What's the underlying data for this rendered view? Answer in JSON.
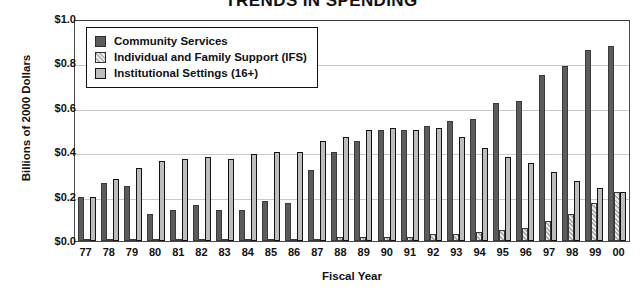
{
  "chart_data": {
    "type": "bar",
    "title": "TRENDS IN SPENDING",
    "xlabel": "Fiscal Year",
    "ylabel": "Billions of 2000 Dollars",
    "ylim": [
      0.0,
      1.0
    ],
    "ytick_labels": [
      "$1.0",
      "$0.8",
      "$0.6",
      "$0.4",
      "$0.2",
      "$0.0"
    ],
    "ytick_values": [
      1.0,
      0.8,
      0.6,
      0.4,
      0.2,
      0.0
    ],
    "grid": true,
    "legend_position": "upper-left",
    "categories": [
      "77",
      "78",
      "79",
      "80",
      "81",
      "82",
      "83",
      "84",
      "85",
      "86",
      "87",
      "88",
      "89",
      "90",
      "91",
      "92",
      "93",
      "94",
      "95",
      "96",
      "97",
      "98",
      "99",
      "00"
    ],
    "series": [
      {
        "name": "Community Services",
        "color": "#5b5b5b",
        "values": [
          0.2,
          0.26,
          0.25,
          0.12,
          0.14,
          0.16,
          0.14,
          0.14,
          0.18,
          0.17,
          0.32,
          0.4,
          0.45,
          0.5,
          0.5,
          0.52,
          0.54,
          0.55,
          0.62,
          0.63,
          0.75,
          0.79,
          0.86,
          0.88
        ]
      },
      {
        "name": "Individual and Family Support (IFS)",
        "color": "#d8d8d8",
        "values": [
          0.01,
          0.01,
          0.01,
          0.01,
          0.01,
          0.01,
          0.01,
          0.01,
          0.01,
          0.01,
          0.01,
          0.02,
          0.02,
          0.02,
          0.02,
          0.03,
          0.03,
          0.04,
          0.05,
          0.06,
          0.09,
          0.12,
          0.17,
          0.22
        ]
      },
      {
        "name": "Institutional Settings (16+)",
        "color": "#bdbdbd",
        "values": [
          0.2,
          0.28,
          0.33,
          0.36,
          0.37,
          0.38,
          0.37,
          0.39,
          0.4,
          0.4,
          0.45,
          0.47,
          0.5,
          0.51,
          0.5,
          0.51,
          0.47,
          0.42,
          0.38,
          0.35,
          0.31,
          0.27,
          0.24,
          0.22
        ]
      }
    ]
  },
  "legend": {
    "items": [
      {
        "label": "Community Services",
        "swatch": "cs"
      },
      {
        "label": "Individual and Family Support (IFS)",
        "swatch": "ifs"
      },
      {
        "label": "Institutional Settings (16+)",
        "swatch": "inst"
      }
    ]
  }
}
